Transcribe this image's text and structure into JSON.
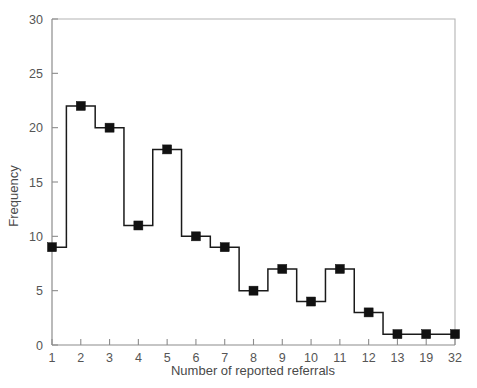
{
  "chart_data": {
    "type": "line",
    "subtype": "step-histogram-with-square-markers",
    "title": "",
    "xlabel": "Number of reported referrals",
    "ylabel": "Frequency",
    "categories": [
      "1",
      "2",
      "3",
      "4",
      "5",
      "6",
      "7",
      "8",
      "9",
      "10",
      "11",
      "12",
      "13",
      "19",
      "32"
    ],
    "values": [
      9,
      22,
      20,
      11,
      18,
      10,
      9,
      5,
      7,
      4,
      7,
      3,
      1,
      1,
      1
    ],
    "series": [
      {
        "name": "Frequency",
        "values": [
          9,
          22,
          20,
          11,
          18,
          10,
          9,
          5,
          7,
          4,
          7,
          3,
          1,
          1,
          1
        ]
      }
    ],
    "ylim": [
      0,
      30
    ],
    "yticks": [
      0,
      5,
      10,
      15,
      20,
      25,
      30
    ],
    "ytick_labels": [
      "0",
      "5",
      "10",
      "15",
      "20",
      "25",
      "30"
    ],
    "xtick_labels": [
      "1",
      "2",
      "3",
      "4",
      "5",
      "6",
      "7",
      "8",
      "9",
      "10",
      "11",
      "12",
      "13",
      "19",
      "32"
    ],
    "grid": false,
    "legend": null,
    "legend_position": "none",
    "marker": "filled-square",
    "line_color": "#1a1a1a",
    "marker_color": "#111111",
    "frame_color": "#b4b4b4",
    "background_color": "#ffffff",
    "axis_spacing": "categorical-equal",
    "annotations": []
  },
  "axes": {
    "y_title": "Frequency",
    "x_title": "Number of reported referrals"
  }
}
